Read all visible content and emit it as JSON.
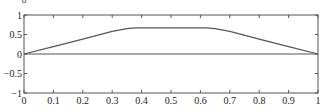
{
  "chart_data": {
    "type": "line",
    "title": "",
    "xlabel": "",
    "ylabel": "δ",
    "xlim": [
      0,
      1
    ],
    "ylim": [
      -1,
      1
    ],
    "grid": false,
    "legend": null,
    "x_ticks": [
      0,
      0.1,
      0.2,
      0.3,
      0.4,
      0.5,
      0.6,
      0.7,
      0.8,
      0.9,
      1
    ],
    "x_tick_labels": [
      "0",
      "0.1",
      "0.2",
      "0.3",
      "0.4",
      "0.5",
      "0.6",
      "0.7",
      "0.8",
      "0.9",
      "1"
    ],
    "y_ticks": [
      -1,
      -0.5,
      0,
      0.5,
      1
    ],
    "y_tick_labels": [
      "−1",
      "−0.5",
      "0",
      "0.5",
      "1"
    ],
    "series": [
      {
        "name": "profile",
        "color": "#555555",
        "x": [
          0,
          0.1,
          0.2,
          0.3,
          0.35,
          0.38,
          0.5,
          0.62,
          0.65,
          0.7,
          0.8,
          0.9,
          1
        ],
        "y": [
          0,
          0.19,
          0.38,
          0.58,
          0.65,
          0.67,
          0.67,
          0.67,
          0.65,
          0.58,
          0.38,
          0.19,
          0
        ]
      },
      {
        "name": "zero-line",
        "color": "#555555",
        "x": [
          0,
          1
        ],
        "y": [
          0,
          0
        ]
      }
    ]
  },
  "plot": {
    "left": 24,
    "top": 15,
    "right": 318,
    "bottom": 93,
    "axis_color": "#555555"
  }
}
